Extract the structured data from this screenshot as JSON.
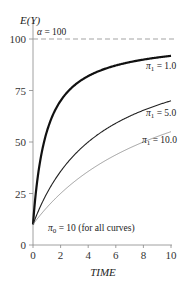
{
  "chart_data": {
    "type": "line",
    "title": "",
    "xlabel": "TIME",
    "ylabel": "E(Y)",
    "xlim": [
      0,
      10
    ],
    "ylim": [
      0,
      100
    ],
    "x_ticks": [
      "0",
      "2",
      "4",
      "6",
      "8",
      "10"
    ],
    "y_ticks": [
      "0",
      "25",
      "50",
      "75",
      "100"
    ],
    "grid": false,
    "asymptote": {
      "label": "α = 100",
      "value": 100,
      "style": "dashed"
    },
    "baseline_annotation": "π0 = 10  (for all curves)",
    "series": [
      {
        "name": "π1 = 1.0",
        "style": "thick",
        "x": [
          0,
          1,
          2,
          3,
          4,
          5,
          6,
          7,
          8,
          9,
          10
        ],
        "values": [
          10,
          55,
          70,
          77.5,
          82,
          85,
          87.1,
          88.8,
          90,
          91,
          91.8
        ]
      },
      {
        "name": "π1 = 5.0",
        "style": "medium",
        "x": [
          0,
          1,
          2,
          3,
          4,
          5,
          6,
          7,
          8,
          9,
          10
        ],
        "values": [
          10,
          25,
          35.7,
          43.8,
          50,
          55,
          59.1,
          62.5,
          65.4,
          67.9,
          70
        ]
      },
      {
        "name": "π1 = 10.0",
        "style": "thin",
        "x": [
          0,
          1,
          2,
          3,
          4,
          5,
          6,
          7,
          8,
          9,
          10
        ],
        "values": [
          10,
          18.2,
          25,
          30.8,
          35.7,
          40,
          43.8,
          47.1,
          50,
          52.6,
          55
        ]
      }
    ]
  },
  "labels": {
    "ylabel": "E(Y)",
    "xlabel": "TIME",
    "alpha": "α = 100",
    "pi0": "π",
    "pi0_sub": "0",
    "pi0_rest": " = 10  (for all curves)",
    "s1_pi": "π",
    "s1_sub": "1",
    "s1_rest": " = 1.0",
    "s2_pi": "π",
    "s2_sub": "1",
    "s2_rest": " = 5.0",
    "s3_pi": "π",
    "s3_sub": "1",
    "s3_rest": " = 10.0"
  }
}
